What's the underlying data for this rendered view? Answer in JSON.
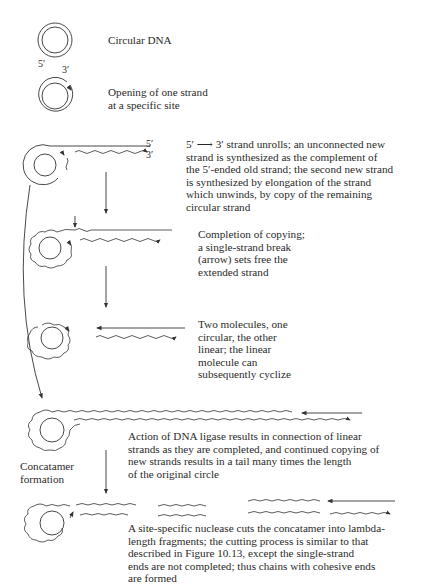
{
  "figure": {
    "type": "lambda DNA rolling-circle replication diagram",
    "steps": [
      {
        "id": "circular",
        "caption": [
          "Circular DNA"
        ]
      },
      {
        "id": "opening",
        "labels": {
          "five_prime": "5′",
          "three_prime": "3′"
        },
        "caption": [
          "Opening of one strand",
          "at a specific site"
        ]
      },
      {
        "id": "unroll",
        "labels": {
          "five_prime": "5′",
          "three_prime": "3′"
        },
        "caption": [
          "5′ ⟶ 3′ strand unrolls; an unconnected new",
          "strand is synthesized as the complement of",
          "the 5′-ended old strand; the second new strand",
          "is synthesized by elongation of the strand",
          "which unwinds, by copy of the remaining",
          "circular strand"
        ]
      },
      {
        "id": "completion",
        "caption": [
          "Completion of copying;",
          "a single-strand break",
          "(arrow) sets free the",
          "extended strand"
        ]
      },
      {
        "id": "two-molecules",
        "caption": [
          "Two molecules, one",
          "circular, the other",
          "linear; the linear",
          "molecule can",
          "subsequently cyclize"
        ]
      },
      {
        "id": "ligase",
        "caption": [
          "Action of DNA ligase results in connection of linear",
          "strands as they are completed, and continued copying of",
          "new strands results in a tail many times the length",
          "of the original circle"
        ]
      },
      {
        "id": "nuclease",
        "caption": [
          "A site-specific nuclease cuts the concatamer into lambda-",
          "length fragments; the cutting process is similar to that",
          "described in Figure 10.13, except the single-strand",
          "ends are not completed; thus chains with cohesive ends",
          "are formed"
        ]
      }
    ],
    "side_label": [
      "Concatamer",
      "formation"
    ]
  }
}
